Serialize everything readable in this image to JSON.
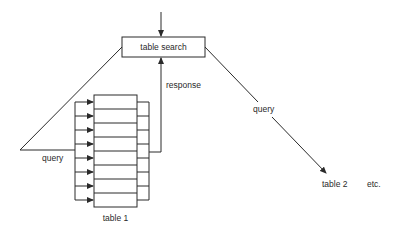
{
  "diagram": {
    "search_box": {
      "label": "table search"
    },
    "labels": {
      "query_left": "query",
      "response": "response",
      "query_right": "query",
      "table1": "table 1",
      "table2": "table 2",
      "etc": "etc."
    },
    "table1": {
      "rows": 8
    },
    "colors": {
      "stroke": "#2a2a2a",
      "background": "#ffffff"
    }
  }
}
